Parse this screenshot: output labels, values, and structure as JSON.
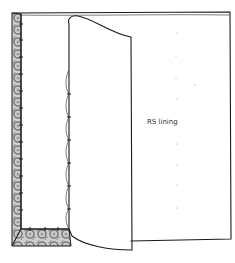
{
  "illustration": {
    "subject": "sewing lining attached to fabric, lining folded back",
    "label": "RS lining"
  },
  "colors": {
    "line": "#1a1a1a",
    "pattern_fabric": "#8a8a8a",
    "background": "#ffffff"
  }
}
